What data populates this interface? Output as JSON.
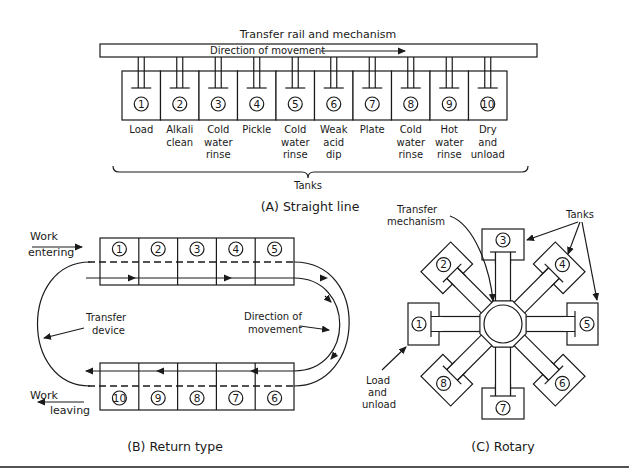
{
  "colors": {
    "ink": "#1a1a1a",
    "background": "#ffffff"
  },
  "straight": {
    "rail_label": "Transfer rail and mechanism",
    "direction_label": "Direction of movement",
    "tanks_label": "Tanks",
    "caption": "(A) Straight line",
    "tanks": [
      {
        "num": "1",
        "lines": [
          "Load"
        ]
      },
      {
        "num": "2",
        "lines": [
          "Alkali",
          "clean"
        ]
      },
      {
        "num": "3",
        "lines": [
          "Cold",
          "water",
          "rinse"
        ]
      },
      {
        "num": "4",
        "lines": [
          "Pickle"
        ]
      },
      {
        "num": "5",
        "lines": [
          "Cold",
          "water",
          "rinse"
        ]
      },
      {
        "num": "6",
        "lines": [
          "Weak",
          "acid",
          "dip"
        ]
      },
      {
        "num": "7",
        "lines": [
          "Plate"
        ]
      },
      {
        "num": "8",
        "lines": [
          "Cold",
          "water",
          "rinse"
        ]
      },
      {
        "num": "9",
        "lines": [
          "Hot",
          "water",
          "rinse"
        ]
      },
      {
        "num": "10",
        "lines": [
          "Dry",
          "and",
          "unload"
        ]
      }
    ]
  },
  "return": {
    "work_entering": [
      "Work",
      "entering"
    ],
    "work_leaving": [
      "Work",
      "leaving"
    ],
    "transfer_device": [
      "Transfer",
      "device"
    ],
    "direction": [
      "Direction of",
      "movement"
    ],
    "top_row": [
      "1",
      "2",
      "3",
      "4",
      "5"
    ],
    "bottom_row": [
      "10",
      "9",
      "8",
      "7",
      "6"
    ],
    "caption": "(B) Return type"
  },
  "rotary": {
    "transfer_mechanism": [
      "Transfer",
      "mechanism"
    ],
    "tanks_label": "Tanks",
    "load_unload": [
      "Load",
      "and",
      "unload"
    ],
    "tank_numbers": [
      "1",
      "2",
      "3",
      "4",
      "5",
      "6",
      "7",
      "8"
    ],
    "caption": "(C) Rotary"
  }
}
